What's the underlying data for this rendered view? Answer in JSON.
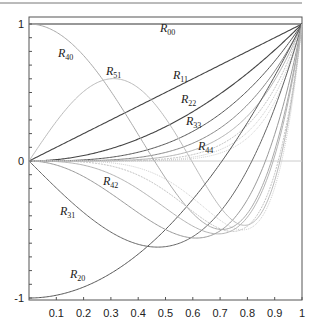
{
  "chart_data": {
    "type": "line",
    "title": "",
    "xlabel": "",
    "ylabel": "",
    "xlim": [
      0,
      1
    ],
    "ylim": [
      -1,
      1
    ],
    "grid": false,
    "legend": "inline labels",
    "x_ticks": [
      "0.1",
      "0.2",
      "0.3",
      "0.4",
      "0.5",
      "0.6",
      "0.7",
      "0.8",
      "0.9",
      "1"
    ],
    "y_ticks": [
      "1",
      "0",
      "-1"
    ],
    "series": [
      {
        "name": "R00",
        "label_main": "R",
        "label_sub": "00",
        "formula": "1",
        "coeffs": [
          [
            1,
            0
          ]
        ],
        "color": "#333333",
        "width": 1.2,
        "dash": "",
        "label_xy": [
          160,
          32
        ]
      },
      {
        "name": "R11",
        "label_main": "R",
        "label_sub": "11",
        "formula": "p",
        "coeffs": [
          [
            1,
            1
          ]
        ],
        "color": "#444444",
        "width": 1.1,
        "dash": "",
        "label_xy": [
          173,
          79
        ]
      },
      {
        "name": "R22",
        "label_main": "R",
        "label_sub": "22",
        "formula": "p^2",
        "coeffs": [
          [
            1,
            2
          ]
        ],
        "color": "#444444",
        "width": 1.1,
        "dash": "",
        "label_xy": [
          181,
          103
        ]
      },
      {
        "name": "R33",
        "label_main": "R",
        "label_sub": "33",
        "formula": "p^3",
        "coeffs": [
          [
            1,
            3
          ]
        ],
        "color": "#555555",
        "width": 1.0,
        "dash": "",
        "label_xy": [
          186,
          125
        ]
      },
      {
        "name": "R44",
        "label_main": "R",
        "label_sub": "44",
        "formula": "p^4",
        "coeffs": [
          [
            1,
            4
          ]
        ],
        "color": "#888888",
        "width": 1.0,
        "dash": "",
        "label_xy": [
          198,
          150
        ]
      },
      {
        "name": "R55",
        "label_main": "",
        "label_sub": "",
        "formula": "p^5",
        "coeffs": [
          [
            1,
            5
          ]
        ],
        "color": "#aaaaaa",
        "width": 0.9,
        "dash": "",
        "label_xy": null
      },
      {
        "name": "R66",
        "label_main": "",
        "label_sub": "",
        "formula": "p^6",
        "coeffs": [
          [
            1,
            6
          ]
        ],
        "color": "#bbbbbb",
        "width": 0.9,
        "dash": "2,1",
        "label_xy": null
      },
      {
        "name": "R77",
        "label_main": "",
        "label_sub": "",
        "formula": "p^7",
        "coeffs": [
          [
            1,
            7
          ]
        ],
        "color": "#c4c4c4",
        "width": 0.9,
        "dash": "1,1",
        "label_xy": null
      },
      {
        "name": "R88",
        "label_main": "",
        "label_sub": "",
        "formula": "p^8",
        "coeffs": [
          [
            1,
            8
          ]
        ],
        "color": "#cccccc",
        "width": 0.9,
        "dash": "1,1",
        "label_xy": null
      },
      {
        "name": "R20",
        "label_main": "R",
        "label_sub": "20",
        "formula": "2p^2-1",
        "coeffs": [
          [
            2,
            2
          ],
          [
            -1,
            0
          ]
        ],
        "color": "#555555",
        "width": 1.0,
        "dash": "",
        "label_xy": [
          70,
          278
        ]
      },
      {
        "name": "R31",
        "label_main": "R",
        "label_sub": "31",
        "formula": "3p^3-2p",
        "coeffs": [
          [
            3,
            3
          ],
          [
            -2,
            1
          ]
        ],
        "color": "#666666",
        "width": 1.0,
        "dash": "",
        "label_xy": [
          60,
          215
        ]
      },
      {
        "name": "R42",
        "label_main": "R",
        "label_sub": "42",
        "formula": "4p^4-3p^2",
        "coeffs": [
          [
            4,
            4
          ],
          [
            -3,
            2
          ]
        ],
        "color": "#999999",
        "width": 1.0,
        "dash": "",
        "label_xy": [
          103,
          185
        ]
      },
      {
        "name": "R53",
        "label_main": "",
        "label_sub": "",
        "formula": "5p^5-4p^3",
        "coeffs": [
          [
            5,
            5
          ],
          [
            -4,
            3
          ]
        ],
        "color": "#aaaaaa",
        "width": 0.9,
        "dash": "",
        "label_xy": null
      },
      {
        "name": "R64",
        "label_main": "",
        "label_sub": "",
        "formula": "6p^6-5p^4",
        "coeffs": [
          [
            6,
            6
          ],
          [
            -5,
            4
          ]
        ],
        "color": "#bbbbbb",
        "width": 0.9,
        "dash": "2,1",
        "label_xy": null
      },
      {
        "name": "R75",
        "label_main": "",
        "label_sub": "",
        "formula": "7p^7-6p^5",
        "coeffs": [
          [
            7,
            7
          ],
          [
            -6,
            5
          ]
        ],
        "color": "#c8c8c8",
        "width": 0.9,
        "dash": "1,1",
        "label_xy": null
      },
      {
        "name": "R40",
        "label_main": "R",
        "label_sub": "40",
        "formula": "6p^4-6p^2+1",
        "coeffs": [
          [
            6,
            4
          ],
          [
            -6,
            2
          ],
          [
            1,
            0
          ]
        ],
        "color": "#aaaaaa",
        "width": 1.0,
        "dash": "",
        "label_xy": [
          58,
          57
        ]
      },
      {
        "name": "R51",
        "label_main": "R",
        "label_sub": "51",
        "formula": "10p^5-12p^3+3p",
        "coeffs": [
          [
            10,
            5
          ],
          [
            -12,
            3
          ],
          [
            3,
            1
          ]
        ],
        "color": "#bbbbbb",
        "width": 1.0,
        "dash": "",
        "label_xy": [
          106,
          75
        ]
      }
    ],
    "zero_line_color": "#cccccc",
    "frame_color": "#555555"
  },
  "layout": {
    "plot_left": 29,
    "plot_right": 302,
    "frame_top": 17,
    "frame_bottom": 300,
    "y_at_1": 24,
    "y_at_0": 161,
    "y_at_neg1": 298
  }
}
